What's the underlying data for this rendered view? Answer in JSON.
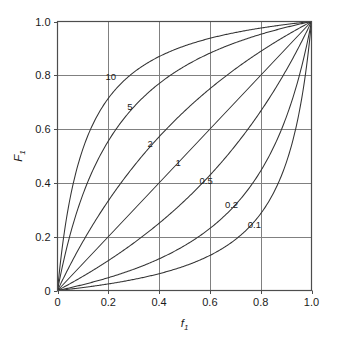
{
  "chart_data": {
    "type": "line",
    "title": "",
    "subtitle": "",
    "xlabel": "f",
    "xlabel_sub": "1",
    "ylabel": "F",
    "ylabel_sub": "1",
    "xlim": [
      0,
      1
    ],
    "ylim": [
      0,
      1
    ],
    "grid": true,
    "legend_position": "inline-curve-labels",
    "xticks": [
      0,
      0.2,
      0.4,
      0.6,
      0.8,
      1.0
    ],
    "xtick_labels": [
      "0",
      "0.2",
      "0.4",
      "0.6",
      "0.8",
      "1.0"
    ],
    "yticks": [
      0,
      0.2,
      0.4,
      0.6,
      0.8,
      1.0
    ],
    "ytick_labels": [
      "0",
      "0.2",
      "0.4",
      "0.6",
      "0.8",
      "1.0"
    ],
    "relation": "F1 = a*f1 / (1 + (a-1)*f1)",
    "series": [
      {
        "name": "10",
        "alpha": 10,
        "label_x": 0.21,
        "label_y": 0.795,
        "x": [
          0,
          0.02,
          0.04,
          0.06,
          0.08,
          0.1,
          0.15,
          0.2,
          0.25,
          0.3,
          0.35,
          0.4,
          0.45,
          0.5,
          0.55,
          0.6,
          0.65,
          0.7,
          0.75,
          0.8,
          0.85,
          0.9,
          0.95,
          1
        ],
        "values": [
          0,
          0.169,
          0.294,
          0.39,
          0.465,
          0.526,
          0.638,
          0.714,
          0.769,
          0.811,
          0.843,
          0.87,
          0.891,
          0.909,
          0.924,
          0.938,
          0.949,
          0.959,
          0.968,
          0.976,
          0.983,
          0.989,
          0.995,
          1
        ]
      },
      {
        "name": "5",
        "alpha": 5,
        "label_x": 0.285,
        "label_y": 0.685,
        "x": [
          0,
          0.02,
          0.04,
          0.06,
          0.08,
          0.1,
          0.15,
          0.2,
          0.25,
          0.3,
          0.35,
          0.4,
          0.45,
          0.5,
          0.55,
          0.6,
          0.65,
          0.7,
          0.75,
          0.8,
          0.85,
          0.9,
          0.95,
          1
        ],
        "values": [
          0,
          0.093,
          0.172,
          0.242,
          0.303,
          0.357,
          0.469,
          0.556,
          0.625,
          0.682,
          0.729,
          0.769,
          0.804,
          0.833,
          0.859,
          0.882,
          0.903,
          0.921,
          0.938,
          0.952,
          0.966,
          0.978,
          0.99,
          1
        ]
      },
      {
        "name": "2",
        "alpha": 2,
        "label_x": 0.365,
        "label_y": 0.545,
        "x": [
          0,
          0.05,
          0.1,
          0.15,
          0.2,
          0.25,
          0.3,
          0.35,
          0.4,
          0.45,
          0.5,
          0.55,
          0.6,
          0.65,
          0.7,
          0.75,
          0.8,
          0.85,
          0.9,
          0.95,
          1
        ],
        "values": [
          0,
          0.095,
          0.182,
          0.261,
          0.333,
          0.4,
          0.462,
          0.519,
          0.571,
          0.621,
          0.667,
          0.71,
          0.75,
          0.788,
          0.824,
          0.857,
          0.889,
          0.919,
          0.947,
          0.974,
          1
        ]
      },
      {
        "name": "1",
        "alpha": 1,
        "label_x": 0.475,
        "label_y": 0.475,
        "x": [
          0,
          0.25,
          0.5,
          0.75,
          1
        ],
        "values": [
          0,
          0.25,
          0.5,
          0.75,
          1
        ]
      },
      {
        "name": "0.5",
        "alpha": 0.5,
        "label_x": 0.585,
        "label_y": 0.41,
        "x": [
          0,
          0.05,
          0.1,
          0.15,
          0.2,
          0.25,
          0.3,
          0.35,
          0.4,
          0.45,
          0.5,
          0.55,
          0.6,
          0.65,
          0.7,
          0.75,
          0.8,
          0.85,
          0.9,
          0.95,
          1
        ],
        "values": [
          0,
          0.026,
          0.053,
          0.081,
          0.111,
          0.143,
          0.176,
          0.212,
          0.25,
          0.29,
          0.333,
          0.379,
          0.429,
          0.481,
          0.538,
          0.6,
          0.667,
          0.739,
          0.818,
          0.905,
          1
        ]
      },
      {
        "name": "0.2",
        "alpha": 0.2,
        "label_x": 0.685,
        "label_y": 0.32,
        "x": [
          0,
          0.05,
          0.1,
          0.15,
          0.2,
          0.25,
          0.3,
          0.35,
          0.4,
          0.45,
          0.5,
          0.55,
          0.6,
          0.65,
          0.7,
          0.75,
          0.8,
          0.85,
          0.9,
          0.95,
          1
        ],
        "values": [
          0,
          0.01,
          0.022,
          0.034,
          0.048,
          0.062,
          0.079,
          0.097,
          0.118,
          0.14,
          0.167,
          0.196,
          0.231,
          0.271,
          0.318,
          0.375,
          0.444,
          0.531,
          0.643,
          0.792,
          1
        ]
      },
      {
        "name": "0.1",
        "alpha": 0.1,
        "label_x": 0.775,
        "label_y": 0.245,
        "x": [
          0,
          0.05,
          0.1,
          0.15,
          0.2,
          0.25,
          0.3,
          0.35,
          0.4,
          0.45,
          0.5,
          0.55,
          0.6,
          0.65,
          0.7,
          0.75,
          0.8,
          0.85,
          0.9,
          0.95,
          1
        ],
        "values": [
          0,
          0.005,
          0.011,
          0.017,
          0.024,
          0.032,
          0.041,
          0.051,
          0.063,
          0.075,
          0.091,
          0.109,
          0.13,
          0.156,
          0.189,
          0.231,
          0.286,
          0.362,
          0.474,
          0.655,
          1
        ]
      }
    ],
    "colors": {
      "background": "#ffffff",
      "axis": "#4d4d4d",
      "grid": "#808080",
      "curve": "#333333",
      "text": "#1a1a1a"
    }
  }
}
